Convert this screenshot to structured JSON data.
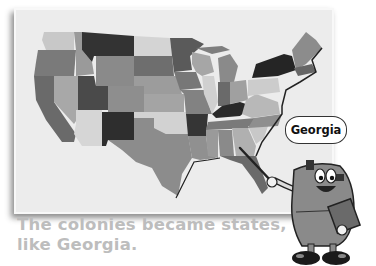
{
  "map": {
    "subject": "United States map with states shaded in grayscale",
    "label": "us-map"
  },
  "speech_bubble": {
    "text": "Georgia"
  },
  "caption": {
    "text": "The colonies became states, like Georgia."
  },
  "character": {
    "description": "cartoon backpack mascot pointing at map with a pointer stick, holding a book"
  },
  "colors": {
    "caption_text": "#bdbdbd",
    "map_background": "#ececec",
    "dark_state": "#3a3a3a",
    "mid_state": "#8a8a8a",
    "light_state": "#cfcfcf"
  }
}
